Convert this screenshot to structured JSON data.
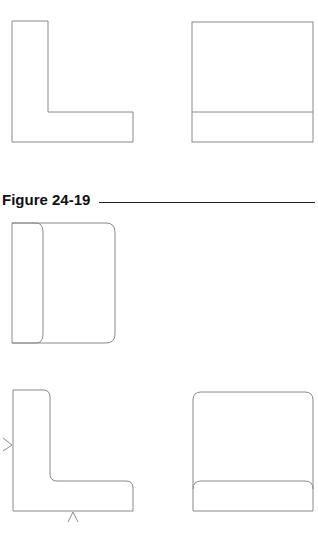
{
  "figure": {
    "label": "Figure 24-19"
  },
  "drawings": {
    "top_row": [
      "l-shape-outline",
      "rectangle-with-bottom-band"
    ],
    "middle": [
      "rounded-rectangle-with-left-panel"
    ],
    "bottom_row": [
      "rounded-l-shape-with-view-arrows",
      "rounded-rectangle-with-bottom-band"
    ]
  },
  "colors": {
    "stroke": "#8a8a8a",
    "label": "#111111"
  }
}
